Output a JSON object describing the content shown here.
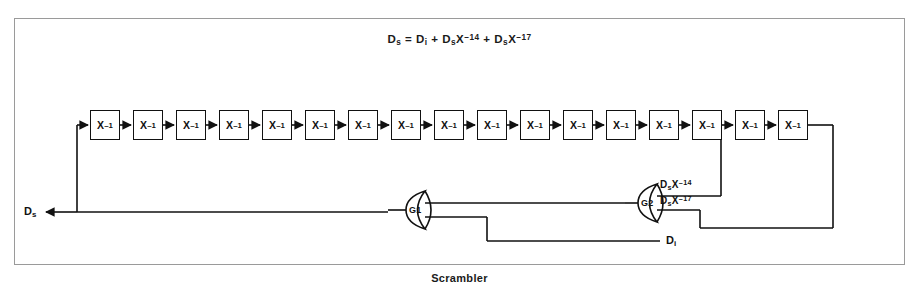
{
  "caption": "Scrambler",
  "formula": {
    "lhs_base": "D",
    "lhs_sub": "s",
    "equals": "=",
    "term1_base": "D",
    "term1_sub": "i",
    "plus1": "+",
    "term2_base": "D",
    "term2_sub": "s",
    "term2_var": "X",
    "term2_exp": "–14",
    "plus2": "+",
    "term3_base": "D",
    "term3_sub": "s",
    "term3_var": "X",
    "term3_exp": "–17",
    "full_text": "Ds = Di + DsX–14 + DsX–17"
  },
  "diagram": {
    "delay_label_base": "X",
    "delay_label_exp": "–1",
    "delay_count": 17,
    "gates": [
      {
        "id": "G1",
        "label": "G1",
        "type": "or-gate",
        "inputs": 2
      },
      {
        "id": "G2",
        "label": "G2",
        "type": "or-gate",
        "inputs": 2
      }
    ],
    "tap_labels": [
      {
        "base": "D",
        "sub": "s",
        "var": "X",
        "exp": "–14",
        "text": "DsX–14"
      },
      {
        "base": "D",
        "sub": "s",
        "var": "X",
        "exp": "–17",
        "text": "DsX–17"
      }
    ],
    "io": {
      "output_base": "D",
      "output_sub": "s",
      "output_text": "Ds",
      "input_base": "D",
      "input_sub": "i",
      "input_text": "Di"
    },
    "colors": {
      "line": "#111111",
      "box_border": "#111111",
      "frame_border": "#9a9a9a",
      "background": "#ffffff",
      "text": "#111111"
    }
  }
}
